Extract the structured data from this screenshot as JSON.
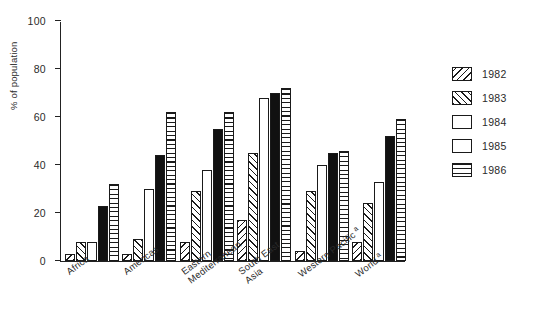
{
  "chart_data": {
    "type": "bar",
    "title": "",
    "xlabel": "",
    "ylabel": "% of population",
    "ylim": [
      0,
      100
    ],
    "ytick_labels": [
      "0",
      "20",
      "40",
      "60",
      "80",
      "100"
    ],
    "yticks": [
      0,
      20,
      40,
      60,
      80,
      100
    ],
    "grid": false,
    "legend_position": "right",
    "categories": [
      "Africa",
      "Americas",
      "Eastern Mediterranean",
      "South East Asia",
      "Western Pacific a",
      "World a"
    ],
    "category_lines": [
      [
        "Africa",
        ""
      ],
      [
        "Americas",
        ""
      ],
      [
        "Eastern",
        "Mediterranean"
      ],
      [
        "South East",
        "Asia"
      ],
      [
        "Western Pacific",
        ""
      ],
      [
        "World",
        ""
      ]
    ],
    "category_footnote_marks": [
      "",
      "",
      "",
      "",
      "a",
      "a"
    ],
    "series": [
      {
        "name": "1982",
        "pattern": "backslash-hatch",
        "values": [
          3,
          3,
          8,
          17,
          4,
          8
        ]
      },
      {
        "name": "1983",
        "pattern": "forwardslash-hatch",
        "values": [
          8,
          9,
          29,
          45,
          29,
          24
        ]
      },
      {
        "name": "1984",
        "pattern": "white-open",
        "values": [
          8,
          30,
          38,
          68,
          40,
          33
        ]
      },
      {
        "name": "1985",
        "pattern": "solid-black",
        "values": [
          23,
          44,
          55,
          70,
          45,
          52
        ]
      },
      {
        "name": "1986",
        "pattern": "horizontal-lines",
        "values": [
          32,
          62,
          62,
          72,
          46,
          59
        ]
      }
    ]
  },
  "legend": {
    "items": [
      {
        "label": "1982"
      },
      {
        "label": "1983"
      },
      {
        "label": "1984"
      },
      {
        "label": "1985"
      },
      {
        "label": "1986"
      }
    ]
  },
  "colors": {
    "ink": "#1a1a1a",
    "axis": "#222222",
    "background": "#ffffff",
    "solid_series": "#111111"
  }
}
